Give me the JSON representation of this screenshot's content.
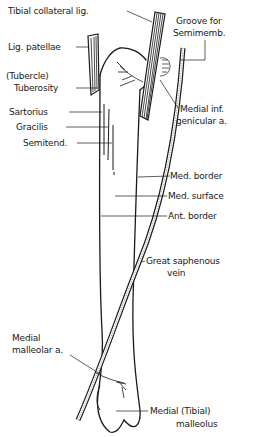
{
  "figure": {
    "ink_color": "#1a1a1a",
    "background": "#ffffff"
  },
  "labels": {
    "tibial_collateral": "Tibial collateral  lig.",
    "groove_1": "Groove for",
    "groove_2": "Semimemb.",
    "lig_patellae": "Lig. patellae",
    "tubercle": "(Tubercle)",
    "tuberosity": "Tuberosity",
    "sartorius": "Sartorius",
    "gracilis": "Gracilis",
    "semitend": "Semitend.",
    "medial_inf_1": "Medial inf.",
    "medial_inf_2": "genicular a.",
    "med_border": "Med. border",
    "med_surface": "Med. surface",
    "ant_border": "Ant. border",
    "saphenous_1": "Great saphenous",
    "saphenous_2": "vein",
    "malleolar_1": "Medial",
    "malleolar_2": "malleolar a.",
    "malleolus_1": "Medial (Tibial)",
    "malleolus_2": "malleolus"
  }
}
